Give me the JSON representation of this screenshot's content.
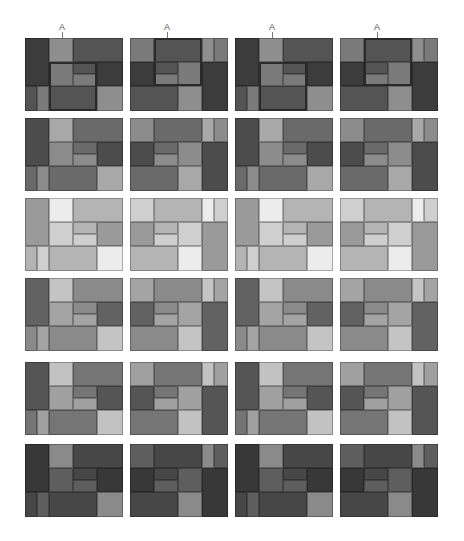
{
  "figure": {
    "columns": 4,
    "rows": 6,
    "panel_size": [
      98,
      73
    ],
    "col_x": [
      25,
      130,
      235,
      340
    ],
    "row_y": [
      38,
      118,
      198,
      278,
      362,
      444
    ],
    "marker_label": "A",
    "row_shades": [
      {
        "dark": "#3c3c3c",
        "mid": "#545454",
        "light": "#7a7a7a",
        "lighter": "#8e8e8e"
      },
      {
        "dark": "#4c4c4c",
        "mid": "#6a6a6a",
        "light": "#8c8c8c",
        "lighter": "#a8a8a8"
      },
      {
        "dark": "#9a9a9a",
        "mid": "#b4b4b4",
        "light": "#cfcfcf",
        "lighter": "#ececec"
      },
      {
        "dark": "#626262",
        "mid": "#8a8a8a",
        "light": "#a4a4a4",
        "lighter": "#c4c4c4"
      },
      {
        "dark": "#555555",
        "mid": "#757575",
        "light": "#a0a0a0",
        "lighter": "#c2c2c2"
      },
      {
        "dark": "#383838",
        "mid": "#474747",
        "light": "#5e5e5e",
        "lighter": "#8a8a8a"
      }
    ]
  },
  "layouts": {
    "A": [
      {
        "x": 0,
        "y": 0,
        "w": 24,
        "h": 48,
        "s": "dark"
      },
      {
        "x": 24,
        "y": 0,
        "w": 24,
        "h": 24,
        "s": "lighter"
      },
      {
        "x": 48,
        "y": 0,
        "w": 50,
        "h": 24,
        "s": "mid"
      },
      {
        "x": 24,
        "y": 24,
        "w": 24,
        "h": 24,
        "s": "light"
      },
      {
        "x": 48,
        "y": 24,
        "w": 24,
        "h": 12,
        "s": "mid"
      },
      {
        "x": 48,
        "y": 36,
        "w": 24,
        "h": 12,
        "s": "light"
      },
      {
        "x": 72,
        "y": 24,
        "w": 26,
        "h": 24,
        "s": "dark"
      },
      {
        "x": 0,
        "y": 48,
        "w": 12,
        "h": 25,
        "s": "mid"
      },
      {
        "x": 12,
        "y": 48,
        "w": 12,
        "h": 25,
        "s": "light"
      },
      {
        "x": 24,
        "y": 48,
        "w": 48,
        "h": 25,
        "s": "mid"
      },
      {
        "x": 72,
        "y": 48,
        "w": 26,
        "h": 25,
        "s": "lighter"
      }
    ],
    "B": [
      {
        "x": 0,
        "y": 0,
        "w": 24,
        "h": 24,
        "s": "light"
      },
      {
        "x": 24,
        "y": 0,
        "w": 48,
        "h": 24,
        "s": "mid"
      },
      {
        "x": 72,
        "y": 0,
        "w": 12,
        "h": 24,
        "s": "lighter"
      },
      {
        "x": 84,
        "y": 0,
        "w": 14,
        "h": 24,
        "s": "light"
      },
      {
        "x": 0,
        "y": 24,
        "w": 24,
        "h": 24,
        "s": "dark"
      },
      {
        "x": 24,
        "y": 24,
        "w": 24,
        "h": 12,
        "s": "mid"
      },
      {
        "x": 24,
        "y": 36,
        "w": 24,
        "h": 12,
        "s": "light"
      },
      {
        "x": 48,
        "y": 24,
        "w": 24,
        "h": 24,
        "s": "light"
      },
      {
        "x": 72,
        "y": 24,
        "w": 26,
        "h": 49,
        "s": "dark"
      },
      {
        "x": 0,
        "y": 48,
        "w": 48,
        "h": 25,
        "s": "mid"
      },
      {
        "x": 48,
        "y": 48,
        "w": 24,
        "h": 25,
        "s": "lighter"
      }
    ]
  },
  "highlights": {
    "A": {
      "x": 24,
      "y": 24,
      "w": 48,
      "h": 49,
      "marker_x": 37
    },
    "B": {
      "x": 24,
      "y": 0,
      "w": 48,
      "h": 48,
      "marker_x": 37
    }
  },
  "column_layout": [
    "A",
    "B",
    "A",
    "B"
  ],
  "highlight_rows": [
    0
  ]
}
